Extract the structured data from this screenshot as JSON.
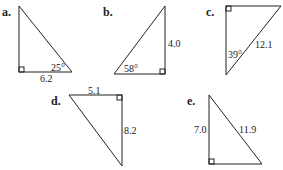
{
  "triangles": [
    {
      "label": "a.",
      "angle": "25°",
      "side": "6.2"
    },
    {
      "label": "b.",
      "angle": "58°",
      "side": "4.0"
    },
    {
      "label": "c.",
      "angle": "39°",
      "side": "12.1"
    },
    {
      "label": "d.",
      "side_top": "5.1",
      "side_right": "8.2"
    },
    {
      "label": "e.",
      "side_left": "7.0",
      "side_hyp": "11.9"
    }
  ]
}
